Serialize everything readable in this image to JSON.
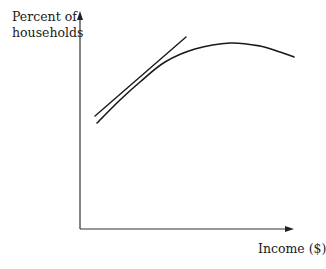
{
  "chart_data": {
    "type": "line",
    "title": "",
    "xlabel": "Income ($)",
    "ylabel_lines": [
      "Percent of",
      "households"
    ],
    "ylabel": "Percent of households",
    "grid": false,
    "legend": null,
    "x_ticks": [],
    "y_ticks": [],
    "series": [
      {
        "name": "curve",
        "description": "Concave curve rising then gently falling (inverted-U)",
        "points_px": [
          [
            97,
            123
          ],
          [
            120,
            100
          ],
          [
            140,
            82
          ],
          [
            165,
            62
          ],
          [
            195,
            49
          ],
          [
            230,
            43
          ],
          [
            260,
            46
          ],
          [
            280,
            52
          ],
          [
            294,
            57
          ]
        ]
      },
      {
        "name": "tangent-line",
        "description": "Straight line tangent to the curve at its lower-left section",
        "points_px": [
          [
            95,
            116
          ],
          [
            186,
            37
          ]
        ]
      }
    ],
    "axes": {
      "origin_px": [
        80,
        229
      ],
      "y_axis_top_px": [
        80,
        12
      ],
      "x_axis_right_px": [
        293,
        229
      ]
    }
  },
  "labels": {
    "ylabel_line1": "Percent of",
    "ylabel_line2": "households",
    "xlabel": "Income ($)"
  }
}
